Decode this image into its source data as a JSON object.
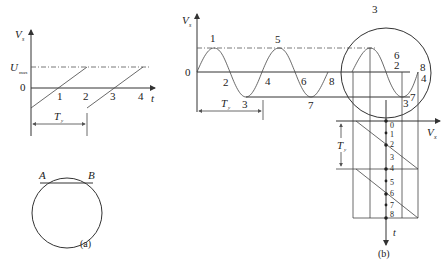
{
  "panel_a": {
    "y_axis_label": "V",
    "y_axis_sub": "s",
    "umax_label": "U",
    "umax_sub": "max",
    "zero_label": "0",
    "x_axis_label": "t",
    "tick_labels": [
      "1",
      "2",
      "3",
      "4"
    ],
    "period_label": "T",
    "period_sub": "y",
    "circle_point_a": "A",
    "circle_point_b": "B",
    "caption": "(a)"
  },
  "panel_b": {
    "y_axis_label": "V",
    "y_axis_sub": "s",
    "zero_label": "0",
    "wave_labels": [
      "1",
      "2",
      "3",
      "4",
      "5",
      "6",
      "7",
      "8"
    ],
    "period_label": "T",
    "period_sub": "y",
    "circle_labels": {
      "top": "3",
      "upper_mid_a": "6",
      "upper_mid_b": "2",
      "right_a": "8",
      "right_b": "4",
      "bottom_a": "3",
      "bottom_b": "7",
      "left": "8"
    },
    "vx_axis_label": "V",
    "vx_axis_sub": "x",
    "t_axis_label": "t",
    "time_points": [
      "0",
      "1",
      "2",
      "3",
      "4",
      "5",
      "6",
      "7",
      "8"
    ],
    "period_label_2": "T",
    "period_sub_2": "y",
    "caption": "(b)"
  }
}
